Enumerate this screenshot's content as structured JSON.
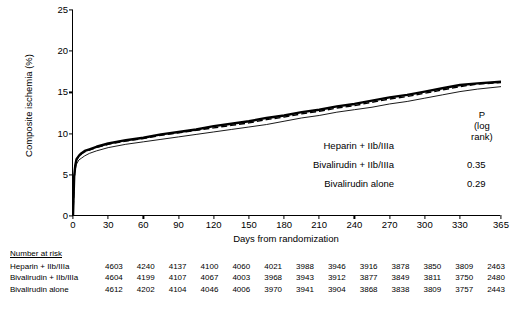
{
  "chart_data": {
    "type": "line",
    "title": "",
    "xlabel": "Days from randomization",
    "ylabel": "Composite ischemia (%)",
    "xlim": [
      0,
      365
    ],
    "ylim": [
      0,
      25
    ],
    "xticks": [
      0,
      30,
      60,
      90,
      120,
      150,
      180,
      210,
      240,
      270,
      300,
      330,
      365
    ],
    "yticks": [
      0,
      5,
      10,
      15,
      20,
      25
    ],
    "grid": false,
    "legend_position": "center-right",
    "series": [
      {
        "name": "Heparin + IIb/IIIa",
        "style": "thin-solid",
        "p": "",
        "x": [
          0,
          1,
          2,
          3,
          5,
          7,
          10,
          14,
          20,
          30,
          45,
          60,
          75,
          90,
          105,
          120,
          135,
          150,
          165,
          180,
          195,
          210,
          225,
          240,
          255,
          270,
          285,
          300,
          315,
          330,
          345,
          365
        ],
        "y": [
          0,
          4.4,
          5.7,
          6.3,
          6.8,
          7.0,
          7.3,
          7.6,
          7.9,
          8.3,
          8.7,
          9.0,
          9.3,
          9.6,
          9.9,
          10.2,
          10.5,
          10.8,
          11.1,
          11.5,
          11.9,
          12.2,
          12.6,
          12.9,
          13.2,
          13.6,
          13.9,
          14.3,
          14.7,
          15.1,
          15.4,
          15.7
        ]
      },
      {
        "name": "Bivalirudin + IIb/IIIa",
        "style": "dashed",
        "p": "0.35",
        "x": [
          0,
          1,
          2,
          3,
          5,
          7,
          10,
          14,
          20,
          30,
          45,
          60,
          75,
          90,
          105,
          120,
          135,
          150,
          165,
          180,
          195,
          210,
          225,
          240,
          255,
          270,
          285,
          300,
          315,
          330,
          345,
          365
        ],
        "y": [
          0,
          4.7,
          6.1,
          6.8,
          7.2,
          7.5,
          7.8,
          8.0,
          8.3,
          8.7,
          9.1,
          9.4,
          9.8,
          10.1,
          10.4,
          10.7,
          11.0,
          11.3,
          11.7,
          12.0,
          12.4,
          12.7,
          13.1,
          13.4,
          13.8,
          14.2,
          14.5,
          14.9,
          15.3,
          15.7,
          16.0,
          16.2
        ]
      },
      {
        "name": "Bivalirudin alone",
        "style": "thick-solid",
        "p": "0.29",
        "x": [
          0,
          1,
          2,
          3,
          5,
          7,
          10,
          14,
          20,
          30,
          45,
          60,
          75,
          90,
          105,
          120,
          135,
          150,
          165,
          180,
          195,
          210,
          225,
          240,
          255,
          270,
          285,
          300,
          315,
          330,
          345,
          365
        ],
        "y": [
          0,
          4.8,
          6.2,
          6.9,
          7.3,
          7.6,
          7.9,
          8.1,
          8.4,
          8.8,
          9.2,
          9.5,
          9.9,
          10.2,
          10.5,
          10.9,
          11.2,
          11.5,
          11.9,
          12.2,
          12.6,
          12.9,
          13.3,
          13.6,
          14.0,
          14.4,
          14.7,
          15.1,
          15.5,
          15.9,
          16.1,
          16.3
        ]
      }
    ]
  },
  "legend": {
    "p_heading_line1": "P",
    "p_heading_line2": "(log rank)"
  },
  "risk_table": {
    "title": "Number at risk",
    "rows": [
      {
        "name": "Heparin + IIb/IIIa",
        "values": [
          "4603",
          "4240",
          "4137",
          "4100",
          "4060",
          "4021",
          "3988",
          "3946",
          "3916",
          "3878",
          "3850",
          "3809",
          "2463"
        ]
      },
      {
        "name": "Bivalirudin + IIb/IIIa",
        "values": [
          "4604",
          "4199",
          "4107",
          "4067",
          "4003",
          "3968",
          "3943",
          "3912",
          "3877",
          "3849",
          "3811",
          "3750",
          "2480"
        ]
      },
      {
        "name": "Bivalirudin alone",
        "values": [
          "4612",
          "4202",
          "4104",
          "4046",
          "4006",
          "3970",
          "3941",
          "3904",
          "3868",
          "3838",
          "3809",
          "3757",
          "2443"
        ]
      }
    ]
  }
}
